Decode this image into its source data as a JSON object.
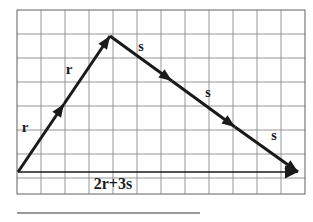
{
  "figure": {
    "background_color": "#ffffff",
    "grid": {
      "line_color": "#8a8a8a",
      "border_color": "#6e6e6e",
      "columns": 12,
      "rows": 8,
      "cell_size": 24,
      "left": 17,
      "top": 10,
      "right": 305,
      "bottom": 194
    },
    "stroke_color": "#1a1a1a",
    "rule_line": {
      "color": "#777777",
      "left": 17,
      "right": 200,
      "y": 213
    }
  },
  "vectors": {
    "origin": {
      "x": 18,
      "y": 172
    },
    "apex": {
      "x": 110,
      "y": 36
    },
    "end": {
      "x": 298,
      "y": 172
    },
    "r_segments": [
      {
        "from": {
          "x": 18,
          "y": 172
        },
        "to": {
          "x": 64,
          "y": 104
        }
      },
      {
        "from": {
          "x": 64,
          "y": 104
        },
        "to": {
          "x": 110,
          "y": 36
        }
      }
    ],
    "s_segments": [
      {
        "from": {
          "x": 110,
          "y": 36
        },
        "to": {
          "x": 172,
          "y": 81
        }
      },
      {
        "from": {
          "x": 172,
          "y": 81
        },
        "to": {
          "x": 235,
          "y": 127
        }
      },
      {
        "from": {
          "x": 235,
          "y": 127
        },
        "to": {
          "x": 298,
          "y": 172
        }
      }
    ],
    "resultant": {
      "from": {
        "x": 18,
        "y": 172
      },
      "to": {
        "x": 298,
        "y": 172
      }
    }
  },
  "labels": {
    "r_lower": {
      "text": "r",
      "x": 25,
      "y": 132
    },
    "r_upper": {
      "text": "r",
      "x": 69,
      "y": 74
    },
    "s_first": {
      "text": "s",
      "x": 141,
      "y": 51
    },
    "s_second": {
      "text": "s",
      "x": 208,
      "y": 97
    },
    "s_third": {
      "text": "s",
      "x": 274,
      "y": 140
    },
    "resultant": {
      "text": "2r+3s",
      "x": 113,
      "y": 189
    }
  }
}
